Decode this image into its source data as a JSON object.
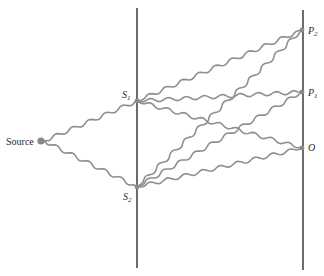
{
  "diagram": {
    "source_label": "Source",
    "slits": [
      {
        "id": "S1",
        "label": "S",
        "subscript": "1"
      },
      {
        "id": "S2",
        "label": "S",
        "subscript": "2"
      }
    ],
    "screen_points": [
      {
        "id": "P2",
        "label": "P",
        "subscript": "2"
      },
      {
        "id": "P1",
        "label": "P",
        "subscript": "1"
      },
      {
        "id": "O",
        "label": "O",
        "subscript": ""
      }
    ],
    "paths": [
      {
        "from": "Source",
        "to": "S1"
      },
      {
        "from": "Source",
        "to": "S2"
      },
      {
        "from": "S1",
        "to": "P2"
      },
      {
        "from": "S1",
        "to": "P1"
      },
      {
        "from": "S1",
        "to": "O"
      },
      {
        "from": "S2",
        "to": "P2"
      },
      {
        "from": "S2",
        "to": "P1"
      },
      {
        "from": "S2",
        "to": "O"
      }
    ],
    "colors": {
      "wave": "#8f8f8f",
      "wall": "#1c1c1c",
      "dot": "#8a8a8a"
    }
  }
}
